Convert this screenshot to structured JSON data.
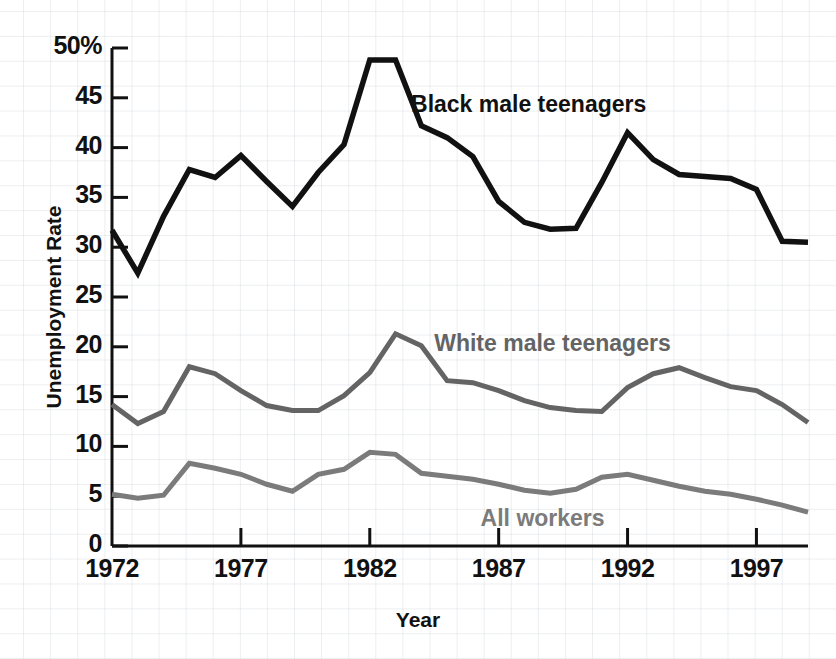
{
  "chart_data": {
    "type": "line",
    "title": "",
    "xlabel": "Year",
    "ylabel": "Unemployment Rate",
    "xlim": [
      1972,
      1999
    ],
    "ylim": [
      0,
      50
    ],
    "grid": true,
    "legend_position": "inline-annotations",
    "x": [
      1972,
      1973,
      1974,
      1975,
      1976,
      1977,
      1978,
      1979,
      1980,
      1981,
      1982,
      1983,
      1984,
      1985,
      1986,
      1987,
      1988,
      1989,
      1990,
      1991,
      1992,
      1993,
      1994,
      1995,
      1996,
      1997,
      1998,
      1999
    ],
    "x_tick_labels": [
      "1972",
      "1977",
      "1982",
      "1987",
      "1992",
      "1997"
    ],
    "x_tick_values": [
      1972,
      1977,
      1982,
      1987,
      1992,
      1997
    ],
    "y_tick_labels": [
      "0",
      "5",
      "10",
      "15",
      "20",
      "25",
      "30",
      "35",
      "40",
      "45",
      "50%"
    ],
    "y_tick_values": [
      0,
      5,
      10,
      15,
      20,
      25,
      30,
      35,
      40,
      45,
      50
    ],
    "series": [
      {
        "name": "Black male teenagers",
        "color": "#111111",
        "width": 5.5,
        "label_x": 1983.6,
        "label_y": 44.2,
        "values": [
          31.7,
          27.4,
          33.1,
          37.8,
          37.0,
          39.2,
          36.6,
          34.1,
          37.5,
          40.3,
          48.8,
          48.8,
          42.2,
          41.0,
          39.1,
          34.6,
          32.5,
          31.8,
          31.9,
          36.5,
          41.5,
          38.8,
          37.3,
          37.1,
          36.9,
          35.8,
          30.6,
          30.5
        ]
      },
      {
        "name": "White male teenagers",
        "color": "#646464",
        "width": 5.0,
        "label_x": 1984.5,
        "label_y": 20.2,
        "values": [
          14.2,
          12.3,
          13.5,
          18.0,
          17.3,
          15.6,
          14.1,
          13.6,
          13.6,
          15.1,
          17.4,
          21.3,
          20.1,
          16.6,
          16.4,
          15.6,
          14.6,
          13.9,
          13.6,
          13.5,
          15.9,
          17.3,
          17.9,
          16.9,
          16.0,
          15.6,
          14.2,
          12.4
        ]
      },
      {
        "name": "All workers",
        "color": "#7b7b7b",
        "width": 5.0,
        "label_x": 1986.3,
        "label_y": 2.6,
        "values": [
          5.2,
          4.8,
          5.1,
          8.3,
          7.8,
          7.2,
          6.2,
          5.5,
          7.2,
          7.7,
          9.4,
          9.2,
          7.3,
          7.0,
          6.7,
          6.2,
          5.6,
          5.3,
          5.7,
          6.9,
          7.2,
          6.6,
          6.0,
          5.5,
          5.2,
          4.7,
          4.1,
          3.4
        ]
      }
    ]
  },
  "axis": {
    "y_title": "Unemployment Rate",
    "x_title": "Year"
  }
}
